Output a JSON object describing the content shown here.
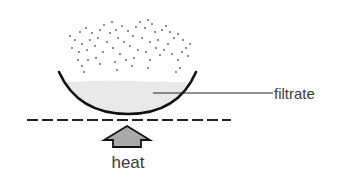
{
  "diagram": {
    "labels": {
      "filtrate": "filtrate",
      "heat": "heat"
    },
    "colors": {
      "bowl_stroke": "#111111",
      "filtrate_fill": "#e9e9e9",
      "arrow_fill": "#a9a9a9",
      "arrow_stroke": "#111111",
      "dash_stroke": "#222222",
      "vapor_dots": "#555555",
      "text": "#3a3a3a"
    },
    "elements": {
      "vessel": "evaporating-dish",
      "vapor": "rising-vapor-dots",
      "surface": "dashed-heating-line",
      "heat_arrow": "up-arrow"
    }
  }
}
